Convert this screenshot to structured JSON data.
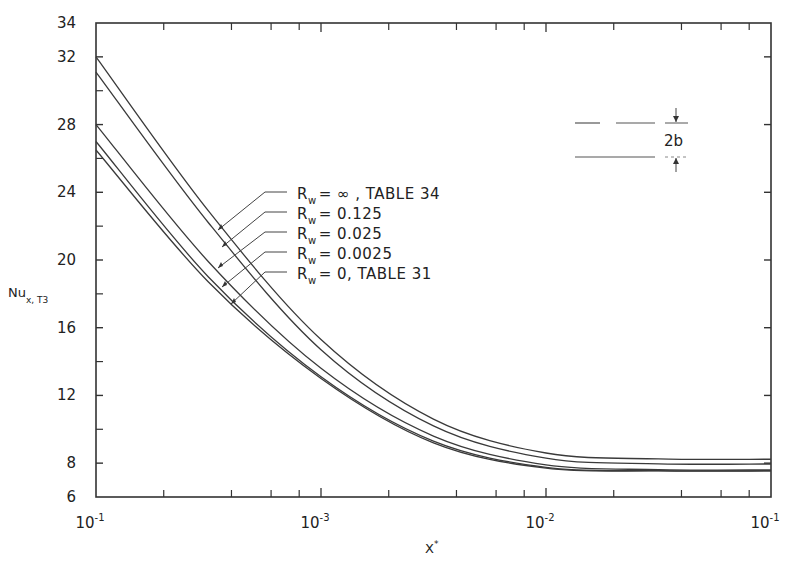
{
  "chart_data": {
    "type": "line",
    "title": "",
    "xlabel": "X*",
    "ylabel": "Nu x,T3",
    "ylabel_main": "Nu",
    "ylabel_sub": "x, T3",
    "xscale": "log",
    "xlim": [
      0.0001,
      0.1
    ],
    "ylim": [
      6,
      34
    ],
    "grid": false,
    "x_tick_labels": [
      {
        "value": 0.0001,
        "base": "10",
        "exp": "-1"
      },
      {
        "value": 0.001,
        "base": "10",
        "exp": "-3"
      },
      {
        "value": 0.01,
        "base": "10",
        "exp": "-2"
      },
      {
        "value": 0.1,
        "base": "10",
        "exp": "-1"
      }
    ],
    "y_ticks": [
      6,
      8,
      12,
      16,
      20,
      24,
      28,
      32,
      34
    ],
    "y_minor_ticks": [
      10,
      14,
      18,
      22,
      26,
      30
    ],
    "x": [
      0.0001,
      0.000316,
      0.001,
      0.00316,
      0.01,
      0.0316,
      0.1
    ],
    "series": [
      {
        "name": "R_w = ∞, TABLE 34",
        "values": [
          32.0,
          22.9,
          15.3,
          10.6,
          8.6,
          8.25,
          8.23
        ]
      },
      {
        "name": "R_w = 0.125",
        "values": [
          31.1,
          22.2,
          14.7,
          10.2,
          8.3,
          7.96,
          7.95
        ]
      },
      {
        "name": "R_w = 0.025",
        "values": [
          28.0,
          19.9,
          13.6,
          9.6,
          7.9,
          7.62,
          7.6
        ]
      },
      {
        "name": "R_w = 0.0025",
        "values": [
          27.0,
          19.0,
          13.1,
          9.3,
          7.75,
          7.56,
          7.55
        ]
      },
      {
        "name": "R_w = 0, TABLE 31",
        "values": [
          26.5,
          18.7,
          13.0,
          9.2,
          7.7,
          7.54,
          7.54
        ]
      }
    ],
    "legend": [
      {
        "prefix": "R",
        "sub": "w",
        "text": "= ∞ ,  TABLE  34"
      },
      {
        "prefix": "R",
        "sub": "w",
        "text": "= 0.125"
      },
      {
        "prefix": "R",
        "sub": "w",
        "text": "= 0.025"
      },
      {
        "prefix": "R",
        "sub": "w",
        "text": "= 0.0025"
      },
      {
        "prefix": "R",
        "sub": "w",
        "text": "= 0,  TABLE   31"
      }
    ],
    "legend_placement": "center-left, with leader arrows to curves",
    "inset": {
      "label": "2b",
      "description": "parallel plates separated by 2b"
    }
  }
}
